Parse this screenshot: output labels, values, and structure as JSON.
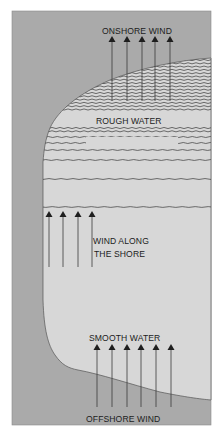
{
  "diagram": {
    "labels": {
      "onshore_wind": "ONSHORE WIND",
      "rough_water": "ROUGH WATER",
      "wind_along_line1": "WIND ALONG",
      "wind_along_line2": "THE SHORE",
      "smooth_water": "SMOOTH WATER",
      "offshore_wind": "OFFSHORE WIND"
    },
    "colors": {
      "land": "#aaaaaa",
      "water": "#d7d7d7",
      "line": "#3a3a3a",
      "arrowhead": "#1e1e1e"
    },
    "arrow_groups": {
      "onshore": {
        "count": 5,
        "direction": "up"
      },
      "along_shore": {
        "count": 4,
        "direction": "up"
      },
      "offshore": {
        "count": 6,
        "direction": "up"
      }
    }
  }
}
